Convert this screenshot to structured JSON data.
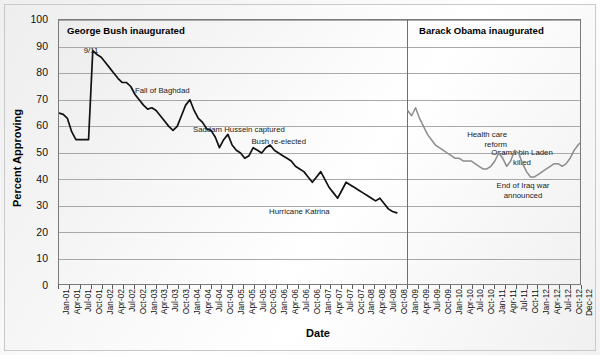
{
  "chart": {
    "type": "line",
    "ylabel": "Percent Approving",
    "xlabel": "Date",
    "ylim": [
      0,
      100
    ],
    "ytick_step": 10,
    "grid": true,
    "legend": "none",
    "background": "#f4f4f4",
    "plot_border_color": "#7a7a7a"
  },
  "axes": {
    "y_ticks": [
      "0",
      "10",
      "20",
      "30",
      "40",
      "50",
      "60",
      "70",
      "80",
      "90",
      "100"
    ],
    "x_ticks": [
      "Jan-01",
      "Apr-01",
      "Jul-01",
      "Oct-01",
      "Jan-02",
      "Apr-02",
      "Jul-02",
      "Oct-02",
      "Jan-03",
      "Apr-03",
      "Jul-03",
      "Oct-03",
      "Jan-04",
      "Apr-04",
      "Jul-04",
      "Oct-04",
      "Jan-05",
      "Apr-05",
      "Jul-05",
      "Oct-05",
      "Jan-06",
      "Apr-06",
      "Jul-06",
      "Oct-06",
      "Jan-07",
      "Apr-07",
      "Jul-07",
      "Oct-07",
      "Jan-08",
      "Apr-08",
      "Jul-08",
      "Oct-08",
      "Jan-09",
      "Apr-09",
      "Jul-09",
      "Oct-09",
      "Jan-10",
      "Apr-10",
      "Jul-10",
      "Oct-10",
      "Jan-11",
      "Apr-11",
      "Jul-11",
      "Oct-11",
      "Jan-12",
      "Apr-12",
      "Jul-12",
      "Oct-12",
      "Dec-12"
    ]
  },
  "eras": [
    {
      "id": "bush",
      "label": "George Bush inaugurated",
      "color": "#1a1a1a"
    },
    {
      "id": "obama",
      "label": "Barack Obama inaugurated",
      "color": "#8c8c8c"
    }
  ],
  "annotations": [
    {
      "id": "sept11",
      "text": "9/11"
    },
    {
      "id": "fall-of-baghdad",
      "text": "Fall of Baghdad"
    },
    {
      "id": "saddam-captured",
      "text": "Saddam Hussein captured"
    },
    {
      "id": "bush-reelected",
      "text": "Bush re-elected"
    },
    {
      "id": "hurricane-katrina",
      "text": "Hurricane Katrina"
    },
    {
      "id": "health-care-reform-l1",
      "text": "Health care"
    },
    {
      "id": "health-care-reform-l2",
      "text": "reform"
    },
    {
      "id": "bin-laden-l1",
      "text": "Osama bin Laden"
    },
    {
      "id": "bin-laden-l2",
      "text": "killed"
    },
    {
      "id": "iraq-war-end-l1",
      "text": "End of Iraq war"
    },
    {
      "id": "iraq-war-end-l2",
      "text": "announced"
    }
  ],
  "chart_data": {
    "type": "line",
    "title": "",
    "xlabel": "Date",
    "ylabel": "Percent Approving",
    "ylim": [
      0,
      100
    ],
    "grid": true,
    "legend": "none",
    "x_axis_range": [
      "Jan-01",
      "Dec-12"
    ],
    "series": [
      {
        "name": "George W. Bush approval",
        "color": "#111111",
        "x_start": "Jan-01",
        "x_end": "Oct-08",
        "values": [
          65,
          64.5,
          63,
          58,
          55,
          55,
          55,
          55,
          88.5,
          87,
          86,
          84,
          82,
          80,
          78,
          76.5,
          76.5,
          75,
          72,
          70,
          68,
          66.5,
          67,
          66,
          64,
          62,
          60,
          58.5,
          60,
          64,
          68,
          70,
          66,
          63,
          61.5,
          59,
          58.5,
          56,
          52,
          55,
          57,
          53,
          51,
          50,
          48,
          49,
          52,
          51,
          50,
          52,
          53,
          51,
          50,
          49,
          48,
          47,
          45,
          44,
          43,
          41,
          39,
          41,
          43,
          40,
          37,
          35,
          33,
          36,
          39,
          38,
          37,
          36,
          35,
          34,
          33,
          32,
          33,
          31,
          29,
          28,
          27.5
        ]
      },
      {
        "name": "Barack Obama approval",
        "color": "#8c8c8c",
        "x_start": "Jan-09",
        "x_end": "Dec-12",
        "values": [
          66,
          64,
          67,
          63,
          60,
          57,
          55,
          53,
          52,
          51,
          50,
          49,
          48,
          48,
          47,
          47,
          47,
          46,
          45,
          44,
          44,
          45,
          47,
          50,
          48,
          45,
          47,
          51,
          50,
          46,
          43,
          41,
          41,
          42,
          43,
          44,
          45,
          46,
          46,
          45,
          46,
          48,
          51,
          53,
          54.5
        ]
      }
    ],
    "annotations": [
      {
        "label": "9/11",
        "x": "Sep-01",
        "y": 88
      },
      {
        "label": "Fall of Baghdad",
        "x": "Apr-03",
        "y": 70
      },
      {
        "label": "Saddam Hussein captured",
        "x": "Dec-03",
        "y": 60
      },
      {
        "label": "Bush re-elected",
        "x": "Nov-04",
        "y": 55
      },
      {
        "label": "Hurricane Katrina",
        "x": "Aug-05",
        "y": 40
      },
      {
        "label": "Health care reform",
        "x": "Mar-10",
        "y": 48
      },
      {
        "label": "Osama bin Laden killed",
        "x": "May-11",
        "y": 51
      },
      {
        "label": "End of Iraq war announced",
        "x": "Dec-11",
        "y": 43
      }
    ],
    "event_markers": [
      {
        "label": "George Bush inaugurated",
        "x": "Jan-01"
      },
      {
        "label": "Barack Obama inaugurated",
        "x": "Jan-09"
      }
    ]
  }
}
